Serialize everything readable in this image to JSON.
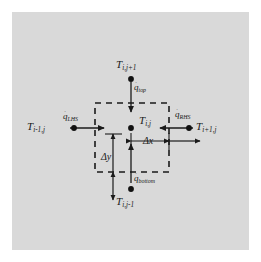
{
  "figure": {
    "panel_color": "#d9d9d9",
    "background_color": "#ffffff",
    "ink_color": "#1a1a1a"
  },
  "nodes": {
    "center": {
      "name": "T",
      "sub": "i,j",
      "x": 131,
      "y": 128
    },
    "top": {
      "name": "T",
      "sub": "i,j+1",
      "x": 131,
      "y": 74
    },
    "bottom": {
      "name": "T",
      "sub": "i,j-1",
      "x": 131,
      "y": 188
    },
    "left": {
      "name": "T",
      "sub": "i-1,j",
      "x": 62,
      "y": 128
    },
    "right": {
      "name": "T",
      "sub": "i+1,j",
      "x": 201,
      "y": 128
    }
  },
  "node_labels": {
    "center": {
      "base": "T",
      "subscript": "i,j"
    },
    "top": {
      "base": "T",
      "subscript": "i,j+1"
    },
    "bottom": {
      "base": "T",
      "subscript": "i,j-1"
    },
    "left": {
      "base": "T",
      "subscript": "i-1,j"
    },
    "right": {
      "base": "T",
      "subscript": "i+1,j"
    }
  },
  "fluxes": {
    "top": {
      "base": "q",
      "dot": "˙",
      "subscript": "top",
      "direction": "down"
    },
    "bottom": {
      "base": "q",
      "dot": "˙",
      "subscript": "bottom",
      "direction": "up"
    },
    "lhs": {
      "base": "q",
      "dot": "˙",
      "subscript": "LHS",
      "direction": "right"
    },
    "rhs": {
      "base": "q",
      "dot": "˙",
      "subscript": "RHS",
      "direction": "left"
    }
  },
  "dimensions": {
    "dx": {
      "label": "Δx"
    },
    "dy": {
      "label": "Δy"
    }
  },
  "control_volume": {
    "style": "dashed",
    "left": 95,
    "top": 103,
    "width": 74,
    "height": 69
  }
}
